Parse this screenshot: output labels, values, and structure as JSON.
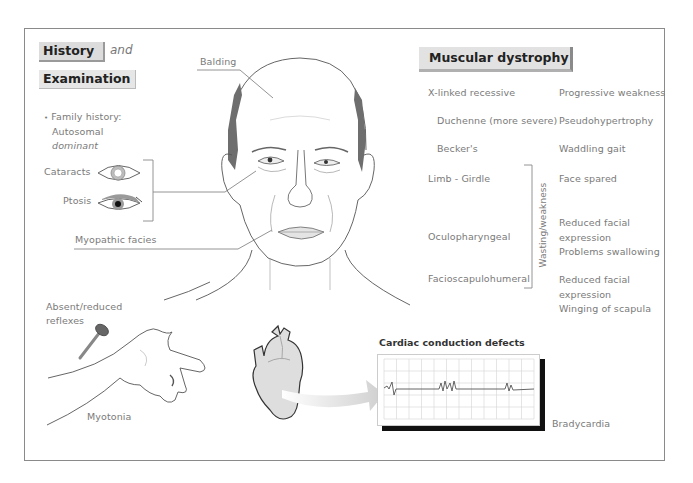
{
  "header": {
    "history_label": "History",
    "and_label": "and",
    "examination_label": "Examination"
  },
  "history": {
    "bullet": "•",
    "family_history_line1": "Family history:",
    "family_history_line2": "Autosomal",
    "family_history_line3": "dominant"
  },
  "eye_signs": {
    "cataracts": "Cataracts",
    "ptosis": "Ptosis"
  },
  "face_labels": {
    "balding": "Balding",
    "myopathic_facies": "Myopathic facies"
  },
  "limb_labels": {
    "reflexes_line1": "Absent/reduced",
    "reflexes_line2": "reflexes",
    "myotonia": "Myotonia"
  },
  "cardiac": {
    "title": "Cardiac conduction defects",
    "bradycardia": "Bradycardia"
  },
  "muscular_dystrophy": {
    "title": "Muscular dystrophy",
    "bracket_label": "Wasting/weakness",
    "rows": [
      {
        "type": "X-linked recessive",
        "features": [
          "Progressive weakness"
        ]
      },
      {
        "type": "Duchenne (more severe)",
        "features": [
          "Pseudohypertrophy"
        ]
      },
      {
        "type": "Becker's",
        "features": [
          "Waddling gait"
        ]
      },
      {
        "type": "Limb - Girdle",
        "features": [
          "Face spared"
        ]
      },
      {
        "type": "Oculopharyngeal",
        "features": [
          "Reduced facial",
          "expression",
          "Problems swallowing"
        ]
      },
      {
        "type": "Facioscapulohumeral",
        "features": [
          "Reduced facial",
          "expression",
          "Winging of scapula"
        ]
      }
    ]
  },
  "colors": {
    "frame": "#8a8a8a",
    "title_bg": "#dcdcdc",
    "label_text": "#7a7a7a",
    "hair": "#6e6e6e",
    "heart_fill": "#dedede"
  }
}
